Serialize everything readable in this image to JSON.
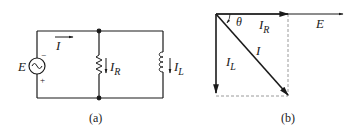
{
  "figure_a": {
    "caption": "(a)",
    "source_label": "E",
    "source_minus": "−",
    "source_plus": "+",
    "source_symbol": "~",
    "total_current_label": "I",
    "resistor_current": {
      "main": "I",
      "sub": "R"
    },
    "inductor_current": {
      "main": "I",
      "sub": "L"
    }
  },
  "figure_b": {
    "caption": "(b)",
    "angle_label": "θ",
    "voltage_label": "E",
    "resistor_phasor": {
      "main": "I",
      "sub": "R"
    },
    "inductor_phasor": {
      "main": "I",
      "sub": "L"
    },
    "total_phasor": "I"
  },
  "colors": {
    "line": "#1a1a1a",
    "dashed": "#9a9a9a"
  }
}
